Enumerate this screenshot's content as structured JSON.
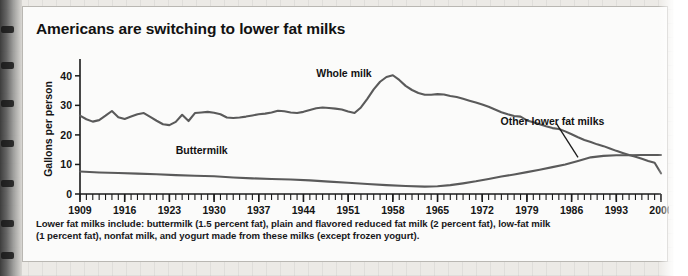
{
  "figure": {
    "title": "Americans are switching to lower fat milks",
    "footnote_line1": "Lower fat milks include: buttermilk (1.5 percent fat), plain and flavored reduced fat milk (2 percent fat), low-fat milk",
    "footnote_line2": "(1 percent fat), nonfat milk, and yogurt made from these milks (except frozen yogurt)."
  },
  "chart_data": {
    "type": "line",
    "title": "Americans are switching to lower fat milks",
    "xlabel": "",
    "ylabel": "Gallons per person",
    "xlim": [
      1909,
      2000
    ],
    "ylim": [
      0,
      44
    ],
    "yticks": [
      0,
      10,
      20,
      30,
      40
    ],
    "ytick_labels": [
      "0",
      "10",
      "20",
      "30",
      "40"
    ],
    "xticks": [
      1909,
      1916,
      1923,
      1930,
      1937,
      1944,
      1951,
      1958,
      1965,
      1972,
      1979,
      1986,
      1993,
      2000
    ],
    "xtick_labels": [
      "1909",
      "1916",
      "1923",
      "1930",
      "1937",
      "1944",
      "1951",
      "1958",
      "1965",
      "1972",
      "1979",
      "1986",
      "1993",
      "2000"
    ],
    "minor_xtick_interval": 1,
    "grid": false,
    "legend": "inline-annotations",
    "line_color": "#5a5a5a",
    "axis_color": "#1a1a1a",
    "annotations": [
      {
        "text": "Whole milk",
        "x": 1946,
        "y": 39.5
      },
      {
        "text": "Buttermilk",
        "x": 1924,
        "y": 13.5
      },
      {
        "text": "Other lower fat milks",
        "x": 1983,
        "y": 23.5,
        "leader_to_x": 1987,
        "leader_to_y": 12.4
      }
    ],
    "series": [
      {
        "name": "Whole milk",
        "x": [
          1909,
          1910,
          1911,
          1912,
          1913,
          1914,
          1915,
          1916,
          1917,
          1918,
          1919,
          1920,
          1921,
          1922,
          1923,
          1924,
          1925,
          1926,
          1927,
          1928,
          1929,
          1930,
          1931,
          1932,
          1933,
          1934,
          1935,
          1936,
          1937,
          1938,
          1939,
          1940,
          1941,
          1942,
          1943,
          1944,
          1945,
          1946,
          1947,
          1948,
          1949,
          1950,
          1951,
          1952,
          1953,
          1954,
          1955,
          1956,
          1957,
          1958,
          1959,
          1960,
          1961,
          1962,
          1963,
          1964,
          1965,
          1966,
          1967,
          1968,
          1969,
          1970,
          1971,
          1972,
          1973,
          1974,
          1975,
          1976,
          1977,
          1978,
          1979,
          1980,
          1981,
          1982,
          1983,
          1984,
          1985,
          1986,
          1987,
          1988,
          1989,
          1990,
          1991,
          1992,
          1993,
          1994,
          1995,
          1996,
          1997,
          1998,
          1999,
          2000
        ],
        "values": [
          26.5,
          25.3,
          24.5,
          25.0,
          26.5,
          28.1,
          26.0,
          25.4,
          26.2,
          27.0,
          27.4,
          26.1,
          24.8,
          23.6,
          23.3,
          24.4,
          26.8,
          24.7,
          27.4,
          27.6,
          27.8,
          27.5,
          27.0,
          25.9,
          25.7,
          25.9,
          26.2,
          26.6,
          27.0,
          27.2,
          27.6,
          28.2,
          28.0,
          27.6,
          27.4,
          27.8,
          28.4,
          29.0,
          29.3,
          29.1,
          28.9,
          28.6,
          27.9,
          27.4,
          29.3,
          32.2,
          35.4,
          38.0,
          39.6,
          40.2,
          38.6,
          36.6,
          35.2,
          34.2,
          33.6,
          33.6,
          33.8,
          33.7,
          33.2,
          32.8,
          32.2,
          31.6,
          31.0,
          30.3,
          29.5,
          28.6,
          27.7,
          27.0,
          26.4,
          26.2,
          24.9,
          24.3,
          23.6,
          22.9,
          22.3,
          22.0,
          21.2,
          20.2,
          19.2,
          18.3,
          17.6,
          16.8,
          16.2,
          15.4,
          14.6,
          13.9,
          13.2,
          12.6,
          11.9,
          11.2,
          10.6,
          7.0
        ]
      },
      {
        "name": "Buttermilk / lower fat milks (rising)",
        "x": [
          1909,
          1912,
          1915,
          1918,
          1921,
          1924,
          1927,
          1930,
          1933,
          1936,
          1939,
          1942,
          1945,
          1948,
          1951,
          1954,
          1957,
          1960,
          1963,
          1965,
          1967,
          1969,
          1971,
          1973,
          1975,
          1977,
          1979,
          1981,
          1983,
          1985,
          1987,
          1989,
          1991,
          1993,
          1995,
          1997,
          1999,
          2000
        ],
        "values": [
          7.6,
          7.3,
          7.1,
          6.9,
          6.7,
          6.4,
          6.2,
          6.0,
          5.6,
          5.3,
          5.1,
          4.9,
          4.6,
          4.2,
          3.8,
          3.4,
          3.0,
          2.7,
          2.5,
          2.6,
          3.0,
          3.6,
          4.3,
          5.1,
          5.9,
          6.6,
          7.4,
          8.2,
          9.1,
          10.0,
          11.2,
          12.4,
          12.9,
          13.1,
          13.1,
          13.2,
          13.2,
          13.2
        ]
      }
    ]
  }
}
